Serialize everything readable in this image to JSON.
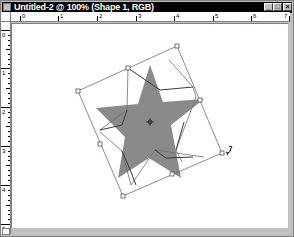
{
  "window": {
    "title": "Untitled-2 @ 100% (Shape 1, RGB)",
    "buttons": {
      "minimize": "_",
      "maximize": "□",
      "close": "×"
    }
  },
  "rulers": {
    "horizontal_labels": [
      "0",
      "1",
      "2",
      "3",
      "4",
      "5",
      "6",
      "7"
    ],
    "vertical_labels": [
      "0",
      "1",
      "2",
      "3",
      "4",
      "5"
    ]
  },
  "shape": {
    "name": "Shape 1",
    "type": "star",
    "fill": "#8a8a8a",
    "transform_tool": "rotate"
  },
  "colors": {
    "titlebar": "#000000",
    "frame": "#c0c0c0",
    "canvas": "#ffffff",
    "shape_fill": "#8a8a8a",
    "bbox_line": "#6e6e6e"
  }
}
